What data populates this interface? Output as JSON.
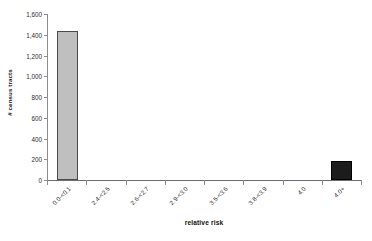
{
  "chart_data": {
    "type": "bar",
    "title": "",
    "xlabel": "relative risk",
    "ylabel": "# census tracts",
    "categories": [
      "0.0-<0.1",
      "2.4-<2.5",
      "2.6-<2.7",
      "2.9-<3.0",
      "3.5-<3.6",
      "3.8-<3.9",
      "4.0",
      "4.0+"
    ],
    "values": [
      1440,
      0,
      0,
      0,
      0,
      0,
      0,
      185
    ],
    "series": [
      {
        "name": "# census tracts",
        "values": [
          1440,
          0,
          0,
          0,
          0,
          0,
          0,
          185
        ]
      }
    ],
    "ylim": [
      0,
      1600
    ],
    "ytick_values": [
      0,
      200,
      400,
      600,
      800,
      1000,
      1200,
      1400,
      1600
    ],
    "ytick_labels": [
      "0",
      "200",
      "400",
      "600",
      "800",
      "1,000",
      "1,200",
      "1,400",
      "1,600"
    ],
    "grid": false,
    "legend": false,
    "legend_position": "none",
    "bar_colors": [
      "#bfbfbf",
      "#bfbfbf",
      "#bfbfbf",
      "#bfbfbf",
      "#bfbfbf",
      "#bfbfbf",
      "#bfbfbf",
      "#1c1c1c"
    ],
    "bar_border_color": "#4a4a4a",
    "axis_color": "#8c8c8c",
    "text_color": "#2b2b2b"
  }
}
